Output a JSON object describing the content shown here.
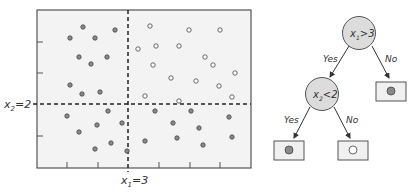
{
  "plot": {
    "frame": {
      "left": 37,
      "top": 10,
      "right": 251,
      "bottom": 168
    },
    "background": "#f3f3f3",
    "split_x": {
      "label_main": "x",
      "label_sub": "1",
      "label_rest": "=3",
      "pos": 128
    },
    "split_y": {
      "label_main": "x",
      "label_sub": "2",
      "label_rest": "=2",
      "pos": 104
    },
    "x_ticks": [
      67,
      98,
      159,
      190,
      220
    ],
    "y_ticks": [
      42,
      73,
      136
    ],
    "filled_color": "#8a8a8a",
    "open_color": "#ffffff",
    "filled_points": [
      [
        83,
        27
      ],
      [
        70,
        38
      ],
      [
        95,
        38
      ],
      [
        115,
        30
      ],
      [
        79,
        57
      ],
      [
        91,
        64
      ],
      [
        107,
        57
      ],
      [
        70,
        85
      ],
      [
        82,
        94
      ],
      [
        100,
        92
      ],
      [
        67,
        116
      ],
      [
        108,
        111
      ],
      [
        97,
        125
      ],
      [
        122,
        123
      ],
      [
        79,
        132
      ],
      [
        111,
        143
      ],
      [
        95,
        149
      ],
      [
        127,
        151
      ],
      [
        155,
        111
      ],
      [
        173,
        123
      ],
      [
        191,
        111
      ],
      [
        145,
        141
      ],
      [
        177,
        138
      ],
      [
        199,
        128
      ],
      [
        203,
        145
      ],
      [
        229,
        117
      ],
      [
        232,
        137
      ]
    ],
    "open_points": [
      [
        150,
        26
      ],
      [
        189,
        30
      ],
      [
        138,
        49
      ],
      [
        156,
        46
      ],
      [
        179,
        46
      ],
      [
        205,
        57
      ],
      [
        153,
        65
      ],
      [
        171,
        78
      ],
      [
        196,
        81
      ],
      [
        145,
        96
      ],
      [
        179,
        101
      ],
      [
        220,
        30
      ],
      [
        213,
        65
      ],
      [
        235,
        73
      ],
      [
        219,
        86
      ],
      [
        232,
        97
      ]
    ]
  },
  "tree": {
    "root": {
      "main": "x",
      "sub": "1",
      "rest": ">3"
    },
    "child": {
      "main": "x",
      "sub": "2",
      "rest": "<2"
    },
    "edges": {
      "root_yes": "Yes",
      "root_no": "No",
      "child_yes": "Yes",
      "child_no": "No"
    },
    "leaves": [
      {
        "id": "no-leaf",
        "class": "filled"
      },
      {
        "id": "yes-yes-leaf",
        "class": "filled"
      },
      {
        "id": "yes-no-leaf",
        "class": "open"
      }
    ],
    "node_fill": "#dcdcdc"
  }
}
